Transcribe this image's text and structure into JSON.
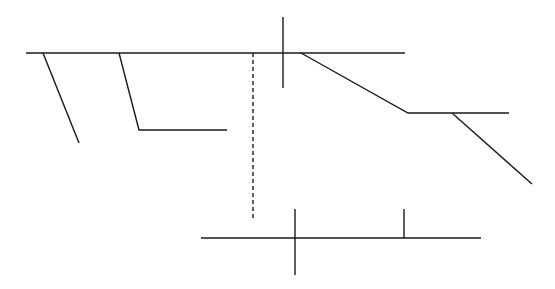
{
  "diagram": {
    "width": 555,
    "height": 289,
    "background": "#ffffff",
    "stroke_color": "#1a1a1a",
    "stroke_width": 1.4,
    "segments": [
      {
        "name": "top-baseline",
        "points": [
          [
            26,
            53
          ],
          [
            405,
            53
          ]
        ],
        "dashed": false
      },
      {
        "name": "left-slant-branch",
        "points": [
          [
            43,
            53
          ],
          [
            79,
            143
          ]
        ],
        "dashed": false
      },
      {
        "name": "second-slant-with-foot",
        "points": [
          [
            119,
            53
          ],
          [
            139,
            130
          ],
          [
            227,
            130
          ]
        ],
        "dashed": false
      },
      {
        "name": "dashed-vertical",
        "points": [
          [
            253,
            53
          ],
          [
            253,
            218
          ]
        ],
        "dashed": true
      },
      {
        "name": "top-cross-vertical",
        "points": [
          [
            283,
            17
          ],
          [
            283,
            88
          ]
        ],
        "dashed": false
      },
      {
        "name": "descending-step",
        "points": [
          [
            301,
            53
          ],
          [
            408,
            113
          ],
          [
            509,
            113
          ]
        ],
        "dashed": false
      },
      {
        "name": "lower-right-slant",
        "points": [
          [
            452,
            113
          ],
          [
            532,
            184
          ]
        ],
        "dashed": false
      },
      {
        "name": "bottom-baseline",
        "points": [
          [
            201,
            238
          ],
          [
            481,
            238
          ]
        ],
        "dashed": false
      },
      {
        "name": "bottom-cross-vertical",
        "points": [
          [
            295,
            209
          ],
          [
            295,
            275
          ]
        ],
        "dashed": false
      },
      {
        "name": "bottom-tick",
        "points": [
          [
            404,
            209
          ],
          [
            404,
            238
          ]
        ],
        "dashed": false
      }
    ]
  }
}
